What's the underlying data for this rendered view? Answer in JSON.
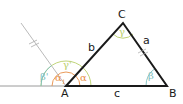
{
  "diagram": {
    "type": "triangle-exterior-angle",
    "vertices": {
      "A": {
        "label": "A"
      },
      "B": {
        "label": "B"
      },
      "C": {
        "label": "C"
      }
    },
    "sides": {
      "a": {
        "label": "a"
      },
      "b": {
        "label": "b"
      },
      "c": {
        "label": "c"
      }
    },
    "angles": {
      "alpha": {
        "label": "α"
      },
      "beta": {
        "label": "β"
      },
      "gamma": {
        "label": "γ"
      },
      "alpha1": {
        "label": "α",
        "subscript": "1"
      },
      "beta_prime": {
        "label": "β'"
      },
      "gamma_prime": {
        "label": "γ'"
      }
    },
    "colors": {
      "alpha": "#e8904a",
      "beta": "#7fbfc0",
      "gamma": "#b9cf6a",
      "triangle": "#1a1a1a",
      "baseline": "#9a9a9a",
      "auxiliary_line": "#a8a8a8"
    }
  }
}
